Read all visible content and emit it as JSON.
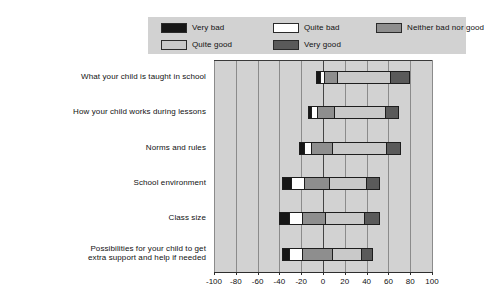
{
  "chart_data": {
    "type": "bar",
    "orientation": "horizontal",
    "stacked": true,
    "diverging": true,
    "title": "",
    "xlabel": "",
    "ylabel": "",
    "xlim": [
      -100,
      100
    ],
    "xticks": [
      -100,
      -80,
      -60,
      -40,
      -20,
      0,
      20,
      40,
      60,
      80,
      100
    ],
    "xticklabels": [
      "-100",
      "-80",
      "-60",
      "-40",
      "-20",
      "0",
      "20",
      "40",
      "60",
      "80",
      "100"
    ],
    "grid": true,
    "legend_position": "top",
    "categories": [
      "What your child is taught in school",
      "How your child works during lessons",
      "Norms and rules",
      "School environment",
      "Class size",
      "Possibilities for your child to get extra support and help if needed"
    ],
    "series": [
      {
        "name": "Very bad",
        "color": "#161616",
        "values": [
          2,
          2,
          4,
          8,
          8,
          6
        ]
      },
      {
        "name": "Quite bad",
        "color": "#ffffff",
        "values": [
          4,
          6,
          6,
          12,
          12,
          12
        ]
      },
      {
        "name": "Neither bad nor good",
        "color": "#8e8e8e",
        "values": [
          18,
          22,
          20,
          23,
          22,
          26
        ]
      },
      {
        "name": "Quite good",
        "color": "#c9c9c9",
        "values": [
          50,
          48,
          50,
          35,
          36,
          28
        ]
      },
      {
        "name": "Very good",
        "color": "#5a5a5a",
        "values": [
          18,
          12,
          14,
          12,
          14,
          10
        ]
      }
    ],
    "bars": [
      {
        "category": "What your child is taught in school",
        "segments": [
          {
            "name": "Very bad",
            "start": -6,
            "end": -4
          },
          {
            "name": "Quite bad",
            "start": -4,
            "end": 0
          },
          {
            "name": "Neither bad nor good",
            "start": 0,
            "end": 12
          },
          {
            "name": "Quite good",
            "start": 12,
            "end": 62
          },
          {
            "name": "Very good",
            "start": 62,
            "end": 80
          }
        ]
      },
      {
        "category": "How your child works during lessons",
        "segments": [
          {
            "name": "Very bad",
            "start": -14,
            "end": -12
          },
          {
            "name": "Quite bad",
            "start": -12,
            "end": -6
          },
          {
            "name": "Neither bad nor good",
            "start": -6,
            "end": 10
          },
          {
            "name": "Quite good",
            "start": 10,
            "end": 58
          },
          {
            "name": "Very good",
            "start": 58,
            "end": 70
          }
        ]
      },
      {
        "category": "Norms and rules",
        "segments": [
          {
            "name": "Very bad",
            "start": -22,
            "end": -18
          },
          {
            "name": "Quite bad",
            "start": -18,
            "end": -12
          },
          {
            "name": "Neither bad nor good",
            "start": -12,
            "end": 8
          },
          {
            "name": "Quite good",
            "start": 8,
            "end": 58
          },
          {
            "name": "Very good",
            "start": 58,
            "end": 72
          }
        ]
      },
      {
        "category": "School environment",
        "segments": [
          {
            "name": "Very bad",
            "start": -38,
            "end": -30
          },
          {
            "name": "Quite bad",
            "start": -30,
            "end": -18
          },
          {
            "name": "Neither bad nor good",
            "start": -18,
            "end": 5
          },
          {
            "name": "Quite good",
            "start": 5,
            "end": 40
          },
          {
            "name": "Very good",
            "start": 40,
            "end": 52
          }
        ]
      },
      {
        "category": "Class size",
        "segments": [
          {
            "name": "Very bad",
            "start": -40,
            "end": -32
          },
          {
            "name": "Quite bad",
            "start": -32,
            "end": -20
          },
          {
            "name": "Neither bad nor good",
            "start": -20,
            "end": 2
          },
          {
            "name": "Quite good",
            "start": 2,
            "end": 38
          },
          {
            "name": "Very good",
            "start": 38,
            "end": 52
          }
        ]
      },
      {
        "category": "Possibilities for your child to get extra support and help if needed",
        "segments": [
          {
            "name": "Very bad",
            "start": -38,
            "end": -32
          },
          {
            "name": "Quite bad",
            "start": -32,
            "end": -20
          },
          {
            "name": "Neither bad nor good",
            "start": -20,
            "end": 8
          },
          {
            "name": "Quite good",
            "start": 8,
            "end": 36
          },
          {
            "name": "Very good",
            "start": 36,
            "end": 46
          }
        ]
      }
    ]
  },
  "legend": {
    "items": [
      {
        "label": "Very bad",
        "swatch": "f-verybad"
      },
      {
        "label": "Quite bad",
        "swatch": "f-quitebad"
      },
      {
        "label": "Neither bad nor good",
        "swatch": "f-neither"
      },
      {
        "label": "Quite good",
        "swatch": "f-quitegood"
      },
      {
        "label": "Very good",
        "swatch": "f-verygood"
      }
    ]
  },
  "categories_display": [
    [
      "What your child is taught in school"
    ],
    [
      "How your child works during lessons"
    ],
    [
      "Norms and rules"
    ],
    [
      "School environment"
    ],
    [
      "Class size"
    ],
    [
      "Possibilities for your child to get",
      "extra support and help if needed"
    ]
  ]
}
